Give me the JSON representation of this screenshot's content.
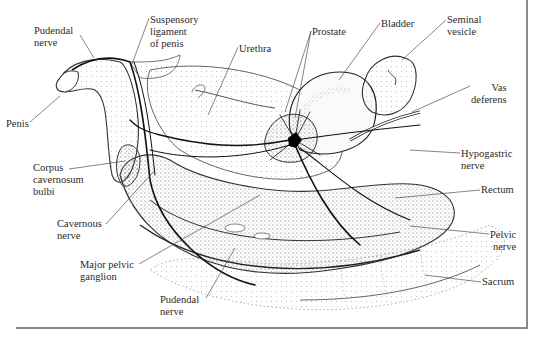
{
  "figure": {
    "type": "anatomical illustration",
    "labels": [
      {
        "id": "pudendal-nerve-top",
        "text": "Pudendal\nnerve",
        "x": 34,
        "y": 25
      },
      {
        "id": "suspensory-ligament",
        "text": "Suspensory\nligament\nof penis",
        "x": 150,
        "y": 14
      },
      {
        "id": "urethra",
        "text": "Urethra",
        "x": 239,
        "y": 43
      },
      {
        "id": "prostate",
        "text": "Prostate",
        "x": 312,
        "y": 26
      },
      {
        "id": "bladder",
        "text": "Bladder",
        "x": 381,
        "y": 18
      },
      {
        "id": "seminal-vesicle",
        "text": "Seminal\nvesicle",
        "x": 447,
        "y": 14
      },
      {
        "id": "vas-deferens",
        "text": "Vas\ndeferens",
        "x": 471,
        "y": 82
      },
      {
        "id": "penis",
        "text": "Penis",
        "x": 6,
        "y": 118
      },
      {
        "id": "hypogastric-nerve",
        "text": "Hypogastric\nnerve",
        "x": 461,
        "y": 148
      },
      {
        "id": "corpus-cavernosum-bulbi",
        "text": "Corpus\ncavernosum\nbulbi",
        "x": 33,
        "y": 162
      },
      {
        "id": "rectum",
        "text": "Rectum",
        "x": 481,
        "y": 184
      },
      {
        "id": "cavernous-nerve",
        "text": "Cavernous\nnerve",
        "x": 57,
        "y": 218
      },
      {
        "id": "pelvic-nerve",
        "text": "Pelvic\nnerve",
        "x": 490,
        "y": 229
      },
      {
        "id": "major-pelvic-ganglion",
        "text": "Major pelvic\nganglion",
        "x": 80,
        "y": 259
      },
      {
        "id": "sacrum",
        "text": "Sacrum",
        "x": 482,
        "y": 276
      },
      {
        "id": "pudendal-nerve-bottom",
        "text": "Pudendal\nnerve",
        "x": 160,
        "y": 294
      }
    ]
  }
}
